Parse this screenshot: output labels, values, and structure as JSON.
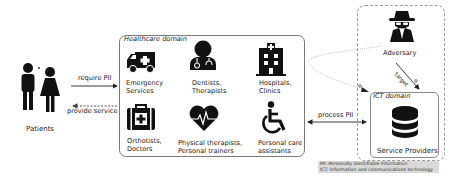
{
  "actors": {
    "patients": {
      "label": "Patients",
      "icon": "patients-icon"
    },
    "adversary": {
      "label": "Adversary",
      "icon": "spy-icon"
    }
  },
  "flows": {
    "require": "require PII",
    "provide": "provide service",
    "process": "process PII",
    "target": "target"
  },
  "healthcare_domain": {
    "title": "Healthcare domain",
    "items": [
      {
        "icon": "ambulance-icon",
        "line1": "Emergency",
        "line2": "Services"
      },
      {
        "icon": "doctor-icon",
        "line1": "Dentists,",
        "line2": "Therapists"
      },
      {
        "icon": "hospital-icon",
        "line1": "Hospitals,",
        "line2": "Clinics"
      },
      {
        "icon": "medical-kit-icon",
        "line1": "Orthotists,",
        "line2": "Doctors"
      },
      {
        "icon": "heartbeat-icon",
        "line1": "Physical therapists,",
        "line2": "Personal trainers"
      },
      {
        "icon": "wheelchair-icon",
        "line1": "Personal care",
        "line2": "assistants"
      }
    ]
  },
  "ict_domain": {
    "title": "ICT domain",
    "label": "Service Providers",
    "icon": "database-icon"
  },
  "legend": {
    "line1": "PII: Personally Identifiable Information",
    "line2": "ICT: Information and communications technology"
  },
  "colors": {
    "icon": "#111111",
    "box_border": "#7a7a7a",
    "dashed_border": "#9a9a9a",
    "legend_bg": "#d9d9d9",
    "dotted_arrow": "#c8c8c8"
  }
}
